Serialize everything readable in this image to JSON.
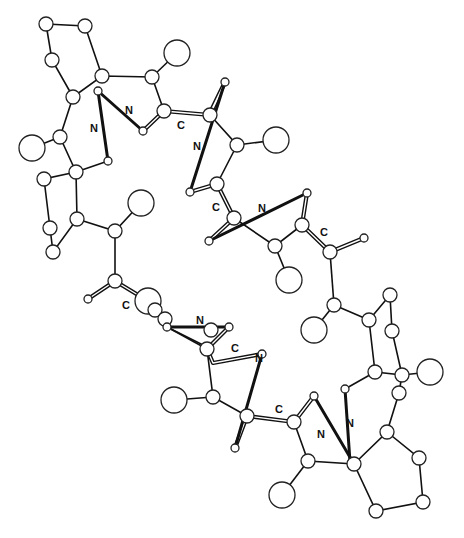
{
  "figure": {
    "type": "ball-and-stick molecular structure",
    "labels": {
      "l1": "N",
      "l2": "N",
      "l3": "C",
      "l4": "N",
      "l5": "C",
      "l6": "N",
      "l7": "C",
      "l8": "C",
      "l9": "N",
      "l10": "C",
      "l11": "N",
      "l12": "C",
      "l13": "N",
      "l14": "N"
    }
  },
  "colors": {
    "background": "#ffffff",
    "ink": "#111111",
    "atom_fill": "#ffffff"
  },
  "atoms": [
    {
      "x": 46,
      "y": 24,
      "r": 7
    },
    {
      "x": 85,
      "y": 26,
      "r": 7
    },
    {
      "x": 52,
      "y": 60,
      "r": 7
    },
    {
      "x": 102,
      "y": 76,
      "r": 7
    },
    {
      "x": 152,
      "y": 77,
      "r": 7
    },
    {
      "x": 177,
      "y": 53,
      "r": 13
    },
    {
      "x": 73,
      "y": 97,
      "r": 7
    },
    {
      "x": 98,
      "y": 91,
      "r": 4
    },
    {
      "x": 164,
      "y": 111,
      "r": 7
    },
    {
      "x": 143,
      "y": 131,
      "r": 4
    },
    {
      "x": 210,
      "y": 115,
      "r": 7
    },
    {
      "x": 225,
      "y": 82,
      "r": 4
    },
    {
      "x": 60,
      "y": 137,
      "r": 7
    },
    {
      "x": 32,
      "y": 148,
      "r": 13
    },
    {
      "x": 108,
      "y": 161,
      "r": 4
    },
    {
      "x": 76,
      "y": 172,
      "r": 7
    },
    {
      "x": 44,
      "y": 179,
      "r": 7
    },
    {
      "x": 50,
      "y": 228,
      "r": 7
    },
    {
      "x": 53,
      "y": 252,
      "r": 7
    },
    {
      "x": 77,
      "y": 219,
      "r": 7
    },
    {
      "x": 115,
      "y": 231,
      "r": 7
    },
    {
      "x": 141,
      "y": 203,
      "r": 13
    },
    {
      "x": 190,
      "y": 192,
      "r": 4
    },
    {
      "x": 217,
      "y": 184,
      "r": 7
    },
    {
      "x": 209,
      "y": 241,
      "r": 4
    },
    {
      "x": 237,
      "y": 145,
      "r": 7
    },
    {
      "x": 276,
      "y": 140,
      "r": 13
    },
    {
      "x": 307,
      "y": 193,
      "r": 4
    },
    {
      "x": 302,
      "y": 225,
      "r": 7
    },
    {
      "x": 275,
      "y": 246,
      "r": 7
    },
    {
      "x": 330,
      "y": 252,
      "r": 7
    },
    {
      "x": 364,
      "y": 238,
      "r": 4
    },
    {
      "x": 289,
      "y": 280,
      "r": 13
    },
    {
      "x": 234,
      "y": 218,
      "r": 7
    },
    {
      "x": 115,
      "y": 281,
      "r": 7
    },
    {
      "x": 88,
      "y": 299,
      "r": 4
    },
    {
      "x": 148,
      "y": 301,
      "r": 13
    },
    {
      "x": 155,
      "y": 310,
      "r": 7
    },
    {
      "x": 165,
      "y": 319,
      "r": 7
    },
    {
      "x": 167,
      "y": 327,
      "r": 4
    },
    {
      "x": 229,
      "y": 327,
      "r": 4
    },
    {
      "x": 207,
      "y": 349,
      "r": 7
    },
    {
      "x": 174,
      "y": 400,
      "r": 13
    },
    {
      "x": 213,
      "y": 397,
      "r": 7
    },
    {
      "x": 334,
      "y": 305,
      "r": 7
    },
    {
      "x": 314,
      "y": 330,
      "r": 13
    },
    {
      "x": 369,
      "y": 320,
      "r": 7
    },
    {
      "x": 390,
      "y": 295,
      "r": 7
    },
    {
      "x": 392,
      "y": 331,
      "r": 7
    },
    {
      "x": 375,
      "y": 372,
      "r": 7
    },
    {
      "x": 402,
      "y": 375,
      "r": 7
    },
    {
      "x": 430,
      "y": 372,
      "r": 13
    },
    {
      "x": 399,
      "y": 393,
      "r": 7
    },
    {
      "x": 345,
      "y": 389,
      "r": 4
    },
    {
      "x": 262,
      "y": 354,
      "r": 4
    },
    {
      "x": 247,
      "y": 416,
      "r": 7
    },
    {
      "x": 235,
      "y": 448,
      "r": 4
    },
    {
      "x": 294,
      "y": 422,
      "r": 7
    },
    {
      "x": 314,
      "y": 396,
      "r": 4
    },
    {
      "x": 387,
      "y": 432,
      "r": 7
    },
    {
      "x": 419,
      "y": 458,
      "r": 7
    },
    {
      "x": 423,
      "y": 502,
      "r": 7
    },
    {
      "x": 376,
      "y": 511,
      "r": 7
    },
    {
      "x": 354,
      "y": 464,
      "r": 7
    },
    {
      "x": 308,
      "y": 461,
      "r": 7
    },
    {
      "x": 282,
      "y": 495,
      "r": 13
    },
    {
      "x": 211,
      "y": 330,
      "r": 7
    }
  ]
}
